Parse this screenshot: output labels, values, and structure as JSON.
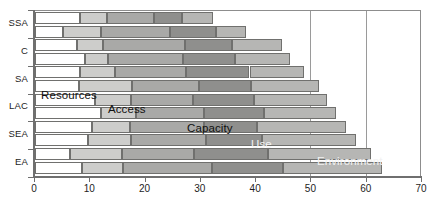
{
  "chart_data": {
    "type": "bar",
    "orientation": "horizontal",
    "stacked": true,
    "title": "",
    "xlabel": "",
    "ylabel": "",
    "xlim": [
      0,
      70
    ],
    "ylim": null,
    "grid": true,
    "legend_position": "inline-overlay",
    "xticks": [
      0,
      10,
      20,
      30,
      40,
      50,
      60,
      70
    ],
    "xticklabels": [
      "0",
      "10",
      "20",
      "30",
      "40",
      "50",
      "60",
      "70"
    ],
    "categories": [
      "SSA",
      "C",
      "SA",
      "LAC",
      "SEA",
      "EA"
    ],
    "series": [
      {
        "name": "Resources",
        "color": "#ffffff"
      },
      {
        "name": "Access",
        "color": "#cdcdcb"
      },
      {
        "name": "Capacity",
        "color": "#a9a9a7"
      },
      {
        "name": "Use",
        "color": "#b6b6b4"
      },
      {
        "name": "Environment",
        "color": "#2b2b2b"
      }
    ],
    "bars": [
      {
        "group": "SSA",
        "sub": 0,
        "values": [
          8.2,
          4.9,
          8.4,
          5.1,
          5.6
        ],
        "total": 32.2
      },
      {
        "group": "SSA",
        "sub": 1,
        "values": [
          5.1,
          6.9,
          12.5,
          8.3,
          5.4
        ],
        "total": 38.2
      },
      {
        "group": "C",
        "sub": 0,
        "values": [
          7.6,
          4.7,
          14.8,
          8.5,
          9.0
        ],
        "total": 44.6
      },
      {
        "group": "C",
        "sub": 1,
        "values": [
          9.0,
          4.2,
          13.6,
          9.4,
          10.0
        ],
        "total": 46.2
      },
      {
        "group": "SA",
        "sub": 0,
        "values": [
          8.2,
          6.2,
          13.0,
          11.4,
          9.8
        ],
        "total": 48.6
      },
      {
        "group": "SA",
        "sub": 1,
        "values": [
          8.0,
          9.5,
          12.2,
          9.4,
          12.2
        ],
        "total": 51.3
      },
      {
        "group": "LAC",
        "sub": 0,
        "values": [
          10.8,
          6.5,
          11.2,
          11.1,
          13.2
        ],
        "total": 52.8
      },
      {
        "group": "LAC",
        "sub": 1,
        "values": [
          11.9,
          6.4,
          12.2,
          11.0,
          13.0
        ],
        "total": 54.5
      },
      {
        "group": "SEA",
        "sub": 0,
        "values": [
          10.3,
          6.9,
          13.3,
          9.7,
          16.0
        ],
        "total": 56.2
      },
      {
        "group": "SEA",
        "sub": 1,
        "values": [
          9.6,
          7.8,
          13.6,
          10.0,
          17.0
        ],
        "total": 58.0
      },
      {
        "group": "EA",
        "sub": 0,
        "values": [
          6.3,
          9.4,
          13.0,
          13.5,
          18.5
        ],
        "total": 60.7
      },
      {
        "group": "EA",
        "sub": 1,
        "values": [
          8.5,
          7.5,
          16.0,
          12.8,
          18.0
        ],
        "total": 62.8
      }
    ],
    "annotations": [
      {
        "text": "Resources",
        "style": "dark"
      },
      {
        "text": "Access",
        "style": "dark"
      },
      {
        "text": "Capacity",
        "style": "dark"
      },
      {
        "text": "Use",
        "style": "light"
      },
      {
        "text": "Environment",
        "style": "light"
      }
    ]
  },
  "axis": {
    "x_labels": [
      "0",
      "10",
      "20",
      "30",
      "40",
      "50",
      "60",
      "70"
    ],
    "y_labels": [
      "SSA",
      "C",
      "SA",
      "LAC",
      "SEA",
      "EA"
    ]
  }
}
